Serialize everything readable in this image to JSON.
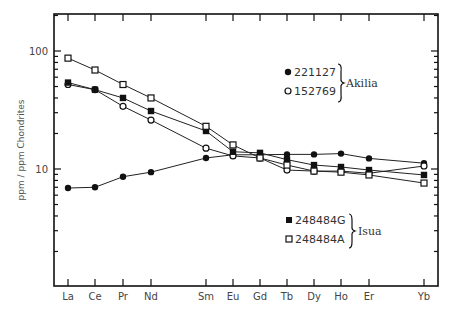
{
  "chart_data": {
    "type": "line",
    "title": "",
    "xlabel": "",
    "ylabel": "ppm / ppm Chondrites",
    "yscale": "log",
    "ylim": [
      1,
      200
    ],
    "grid": false,
    "categories": [
      "La",
      "Ce",
      "Pr",
      "Nd",
      "Sm",
      "Eu",
      "Gd",
      "Tb",
      "Dy",
      "Ho",
      "Er",
      "Yb"
    ],
    "y_tick_labels": [
      "10",
      "100"
    ],
    "series": [
      {
        "name": "221127",
        "group": "Akilia",
        "marker": "filled-circle",
        "values": [
          6.9,
          7.0,
          8.6,
          9.4,
          12.4,
          13.2,
          13.2,
          13.3,
          13.3,
          13.5,
          12.3,
          11.2
        ]
      },
      {
        "name": "152769",
        "group": "Akilia",
        "marker": "open-circle",
        "values": [
          52,
          47,
          34,
          26,
          15,
          12.9,
          12.4,
          9.8,
          9.6,
          9.6,
          9.2,
          10.6
        ]
      },
      {
        "name": "248484G",
        "group": "Isua",
        "marker": "filled-square",
        "values": [
          54,
          47,
          40,
          31,
          21,
          14,
          13.7,
          12,
          10.8,
          10.4,
          9.8,
          8.9
        ]
      },
      {
        "name": "248484A",
        "group": "Isua",
        "marker": "open-square",
        "values": [
          87,
          69,
          52,
          40,
          23,
          16,
          12.4,
          10.8,
          9.6,
          9.4,
          8.9,
          7.6
        ]
      }
    ],
    "legend": {
      "groups": [
        {
          "label": "Akilia",
          "entries": [
            "221127",
            "152769"
          ],
          "position": "upper-right"
        },
        {
          "label": "Isua",
          "entries": [
            "248484G",
            "248484A"
          ],
          "position": "lower-right"
        }
      ]
    },
    "x_positions_px": [
      68,
      95,
      123,
      151,
      206,
      233,
      260,
      287,
      314,
      341,
      369,
      424
    ]
  },
  "legend": {
    "akilia_label": "Akilia",
    "isua_label": "Isua",
    "s1": "221127",
    "s2": "152769",
    "s3": "248484G",
    "s4": "248484A"
  },
  "axis": {
    "ylabel": "ppm / ppm Chondrites",
    "y100": "100",
    "y10": "10"
  }
}
